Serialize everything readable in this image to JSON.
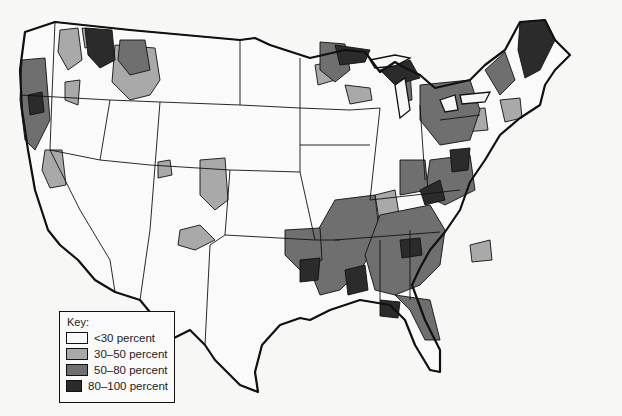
{
  "map": {
    "subject": "Contiguous United States choropleth",
    "legend": {
      "title": "Key:",
      "items": [
        {
          "label": "<30 percent",
          "color": "#fafafa"
        },
        {
          "label": "30–50 percent",
          "color": "#a9a9a9"
        },
        {
          "label": "50–80 percent",
          "color": "#6f6f6f"
        },
        {
          "label": "80–100 percent",
          "color": "#2b2b2b"
        }
      ]
    },
    "colors": {
      "background": "#f7f7f5",
      "border": "#111111"
    }
  }
}
